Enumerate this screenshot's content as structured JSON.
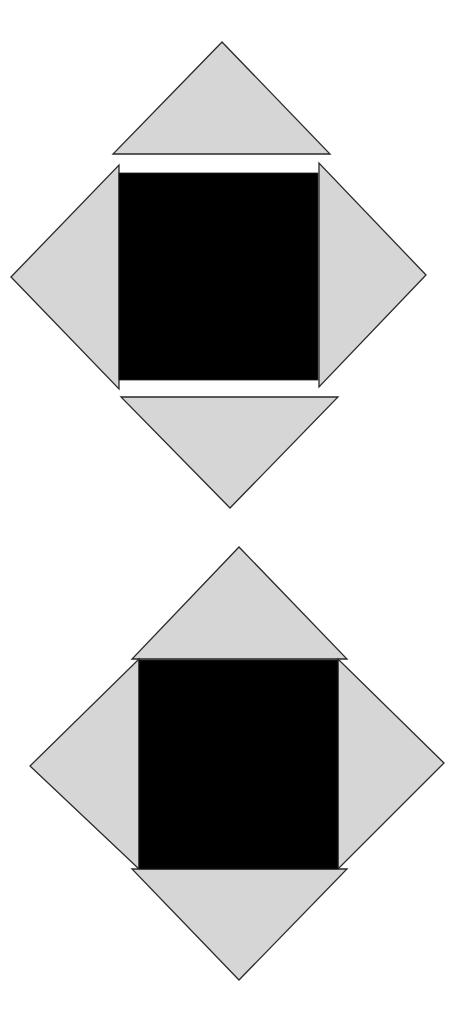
{
  "diagram": {
    "colors": {
      "triangle_fill": "#d6d6d6",
      "square_fill": "#000000",
      "outline": "#2a2a2a",
      "background": "#ffffff"
    },
    "figures": [
      {
        "name": "exploded",
        "square": {
          "x": 119,
          "y": 173,
          "w": 199,
          "h": 207
        },
        "triangles": {
          "top": "222,42 113,154 330,154",
          "left": "11,277 119,165 119,389",
          "right": "426,275 319,163 319,387",
          "bottom": "230,508 121,397 338,397"
        }
      },
      {
        "name": "assembled",
        "square": {
          "x": 139,
          "y": 660,
          "w": 199,
          "h": 209
        },
        "triangles": {
          "top": "239,547 132,659 347,659",
          "left": "30,766 139,659 139,869",
          "right": "444,763 338,659 338,869",
          "bottom": "239,980 132,869 347,869"
        }
      }
    ]
  }
}
